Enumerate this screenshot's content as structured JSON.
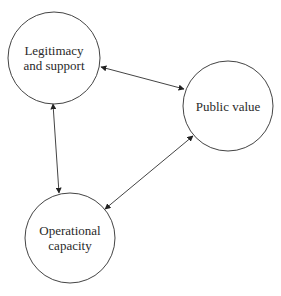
{
  "diagram": {
    "type": "cycle",
    "stroke_color": "#444444",
    "nodes": [
      {
        "id": "legitimacy",
        "label_lines": [
          "Legitimacy",
          "and support"
        ],
        "cx": 54,
        "cy": 58,
        "r": 46
      },
      {
        "id": "public_value",
        "label_lines": [
          "Public value"
        ],
        "cx": 228,
        "cy": 106,
        "r": 45
      },
      {
        "id": "operational",
        "label_lines": [
          "Operational",
          "capacity"
        ],
        "cx": 70,
        "cy": 238,
        "r": 45
      }
    ],
    "edges": [
      {
        "from": "legitimacy",
        "to": "public_value",
        "bidirectional": true,
        "x1": 101,
        "y1": 67,
        "x2": 184,
        "y2": 89
      },
      {
        "from": "legitimacy",
        "to": "operational",
        "bidirectional": true,
        "x1": 53,
        "y1": 104,
        "x2": 59,
        "y2": 193
      },
      {
        "from": "operational",
        "to": "public_value",
        "bidirectional": true,
        "x1": 105,
        "y1": 209,
        "x2": 193,
        "y2": 136
      }
    ]
  }
}
